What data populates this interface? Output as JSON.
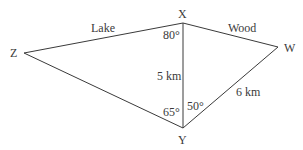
{
  "diagram": {
    "points": {
      "X": {
        "label": "X",
        "x": 183,
        "y": 23
      },
      "Z": {
        "label": "Z",
        "x": 24,
        "y": 53
      },
      "W": {
        "label": "W",
        "x": 278,
        "y": 47
      },
      "Y": {
        "label": "Y",
        "x": 183,
        "y": 128
      }
    },
    "edges": [
      {
        "from": "Z",
        "to": "X",
        "label": "Lake"
      },
      {
        "from": "X",
        "to": "W",
        "label": "Wood"
      },
      {
        "from": "X",
        "to": "Y",
        "label": "5 km"
      },
      {
        "from": "Y",
        "to": "W",
        "label": "6 km"
      },
      {
        "from": "Z",
        "to": "Y",
        "label": ""
      }
    ],
    "angles": {
      "ZXY": "80°",
      "ZYX": "65°",
      "XYW": "50°"
    }
  }
}
